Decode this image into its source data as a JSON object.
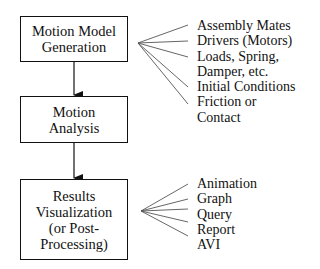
{
  "boxes": [
    {
      "id": "generation",
      "lines": [
        "Motion Model",
        "Generation"
      ]
    },
    {
      "id": "analysis",
      "lines": [
        "Motion",
        "Analysis"
      ]
    },
    {
      "id": "visualization",
      "lines": [
        "Results",
        "Visualization",
        "(or Post-",
        "Processing)"
      ]
    }
  ],
  "generation_inputs": [
    "Assembly Mates",
    "Drivers (Motors)",
    "Loads, Spring,",
    "Damper, etc.",
    "Initial Conditions",
    "Friction or",
    "Contact"
  ],
  "visualization_outputs": [
    "Animation",
    "Graph",
    "Query",
    "Report",
    "AVI"
  ],
  "colors": {
    "stroke": "#111111",
    "fan_line": "#555555",
    "background": "#ffffff"
  }
}
